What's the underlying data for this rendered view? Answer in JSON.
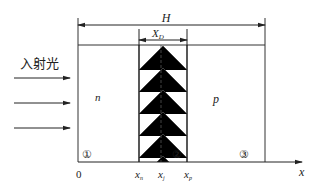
{
  "diagram": {
    "incident_light_label": "入射光",
    "dimension_total_label": "H",
    "dimension_depletion_label": "X",
    "dimension_depletion_subscript": "D",
    "region_n_label": "n",
    "region_p_label": "p",
    "region_markers": [
      "①",
      "②",
      "③"
    ],
    "axis": {
      "origin_label": "0",
      "axis_label": "x",
      "ticks": [
        {
          "main": "x",
          "sub": "n"
        },
        {
          "main": "x",
          "sub": "j"
        },
        {
          "main": "x",
          "sub": "p"
        }
      ]
    },
    "incident_arrow_count": 3
  }
}
